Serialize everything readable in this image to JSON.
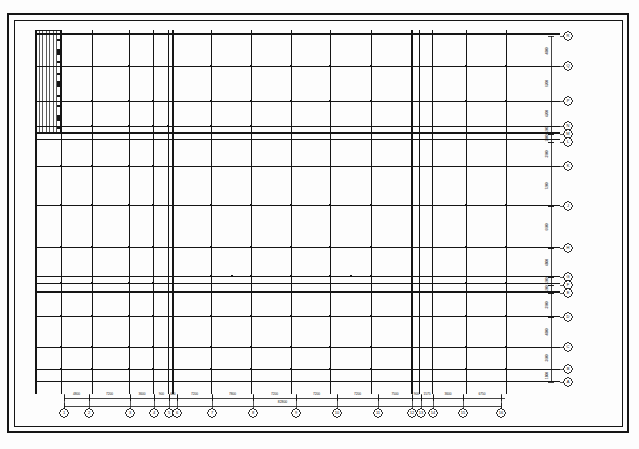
{
  "drawing": {
    "kind": "structural-column-grid-plan",
    "sheet_background": "#fdfdfd",
    "ink_color": "#151515",
    "border": {
      "outer": {
        "x": 8,
        "y": 14,
        "w": 620,
        "h": 418,
        "stroke": "#151515",
        "stroke_width": 1.6
      },
      "inner": {
        "x": 14,
        "y": 20,
        "w": 608,
        "h": 406,
        "stroke": "#151515",
        "stroke_width": 1.0
      }
    },
    "plan_extent": {
      "left": 36,
      "right": 560,
      "top": 30,
      "bottom": 394
    },
    "grid_lines_vertical": [
      {
        "id": "V1",
        "x": 36,
        "weight": 1.5,
        "label": "1"
      },
      {
        "id": "V2",
        "x": 61,
        "weight": 1.0,
        "label": "2"
      },
      {
        "id": "V3",
        "x": 92,
        "weight": 1.0,
        "label": "3"
      },
      {
        "id": "V4",
        "x": 129,
        "weight": 1.0,
        "label": "4"
      },
      {
        "id": "V5",
        "x": 153,
        "weight": 1.0,
        "label": "5"
      },
      {
        "id": "V6",
        "x": 168,
        "weight": 1.0,
        "label": "6"
      },
      {
        "id": "V6a",
        "x": 173,
        "weight": 1.5,
        "label": "6a"
      },
      {
        "id": "V7",
        "x": 211,
        "weight": 1.0,
        "label": "7"
      },
      {
        "id": "V8",
        "x": 251,
        "weight": 1.0,
        "label": "8"
      },
      {
        "id": "V9",
        "x": 291,
        "weight": 1.0,
        "label": "9"
      },
      {
        "id": "V10",
        "x": 330,
        "weight": 1.0,
        "label": "10"
      },
      {
        "id": "V11",
        "x": 371,
        "weight": 1.0,
        "label": "11"
      },
      {
        "id": "V12",
        "x": 412,
        "weight": 1.5,
        "label": "12"
      },
      {
        "id": "V12a",
        "x": 419,
        "weight": 1.0,
        "label": "12a"
      },
      {
        "id": "V13",
        "x": 432,
        "weight": 1.0,
        "label": "13"
      },
      {
        "id": "V14",
        "x": 466,
        "weight": 1.0,
        "label": "14"
      },
      {
        "id": "V15",
        "x": 506,
        "weight": 1.0,
        "label": "15"
      }
    ],
    "grid_lines_horizontal": [
      {
        "id": "HR",
        "y": 34,
        "weight": 1.5,
        "label": "R"
      },
      {
        "id": "HQ",
        "y": 66,
        "weight": 1.0,
        "label": "Q"
      },
      {
        "id": "HP",
        "y": 101,
        "weight": 1.0,
        "label": "P"
      },
      {
        "id": "HN",
        "y": 126,
        "weight": 1.0,
        "label": "N"
      },
      {
        "id": "HM",
        "y": 133,
        "weight": 1.5,
        "label": "M"
      },
      {
        "id": "HL",
        "y": 139,
        "weight": 1.0,
        "label": "L"
      },
      {
        "id": "HK",
        "y": 166,
        "weight": 1.0,
        "label": "K"
      },
      {
        "id": "HJ",
        "y": 205,
        "weight": 1.0,
        "label": "J"
      },
      {
        "id": "HH",
        "y": 247,
        "weight": 1.0,
        "label": "H"
      },
      {
        "id": "HG",
        "y": 276,
        "weight": 1.0,
        "label": "G"
      },
      {
        "id": "HF",
        "y": 283,
        "weight": 1.0,
        "label": "F"
      },
      {
        "id": "HE",
        "y": 292,
        "weight": 1.5,
        "label": "E"
      },
      {
        "id": "HD",
        "y": 316,
        "weight": 1.0,
        "label": "D"
      },
      {
        "id": "HC",
        "y": 347,
        "weight": 1.0,
        "label": "C"
      },
      {
        "id": "HB",
        "y": 369,
        "weight": 1.0,
        "label": "B"
      },
      {
        "id": "HA",
        "y": 381,
        "weight": 1.0,
        "label": "A"
      }
    ],
    "left_hatch_block": {
      "x": 36,
      "y": 30,
      "w": 24,
      "h": 102,
      "line_count": 7,
      "note": "dense vertical hatch strip upper-left"
    },
    "columns": [
      {
        "x": 129,
        "y": 66
      },
      {
        "x": 173,
        "y": 66
      },
      {
        "x": 211,
        "y": 66
      },
      {
        "x": 251,
        "y": 66
      },
      {
        "x": 291,
        "y": 66
      },
      {
        "x": 330,
        "y": 66
      },
      {
        "x": 371,
        "y": 66
      },
      {
        "x": 412,
        "y": 66
      },
      {
        "x": 466,
        "y": 66
      },
      {
        "x": 506,
        "y": 66
      },
      {
        "x": 61,
        "y": 101
      },
      {
        "x": 92,
        "y": 101
      },
      {
        "x": 129,
        "y": 101
      },
      {
        "x": 153,
        "y": 101
      },
      {
        "x": 173,
        "y": 101
      },
      {
        "x": 211,
        "y": 101
      },
      {
        "x": 251,
        "y": 101
      },
      {
        "x": 291,
        "y": 101
      },
      {
        "x": 330,
        "y": 101
      },
      {
        "x": 371,
        "y": 101
      },
      {
        "x": 412,
        "y": 101
      },
      {
        "x": 466,
        "y": 101
      },
      {
        "x": 506,
        "y": 101
      },
      {
        "x": 61,
        "y": 126
      },
      {
        "x": 92,
        "y": 126
      },
      {
        "x": 129,
        "y": 126
      },
      {
        "x": 153,
        "y": 126
      },
      {
        "x": 168,
        "y": 126
      },
      {
        "x": 211,
        "y": 126
      },
      {
        "x": 251,
        "y": 126
      },
      {
        "x": 173,
        "y": 133
      },
      {
        "x": 211,
        "y": 133
      },
      {
        "x": 232,
        "y": 133
      },
      {
        "x": 243,
        "y": 133
      },
      {
        "x": 266,
        "y": 133
      },
      {
        "x": 290,
        "y": 133
      },
      {
        "x": 305,
        "y": 133
      },
      {
        "x": 316,
        "y": 133
      },
      {
        "x": 330,
        "y": 133
      },
      {
        "x": 371,
        "y": 133
      },
      {
        "x": 412,
        "y": 133
      },
      {
        "x": 432,
        "y": 133
      },
      {
        "x": 466,
        "y": 133
      },
      {
        "x": 506,
        "y": 133
      },
      {
        "x": 61,
        "y": 166
      },
      {
        "x": 92,
        "y": 166
      },
      {
        "x": 129,
        "y": 166
      },
      {
        "x": 153,
        "y": 166
      },
      {
        "x": 173,
        "y": 166
      },
      {
        "x": 173,
        "y": 152
      },
      {
        "x": 412,
        "y": 152
      },
      {
        "x": 61,
        "y": 205
      },
      {
        "x": 92,
        "y": 205
      },
      {
        "x": 129,
        "y": 205
      },
      {
        "x": 153,
        "y": 205
      },
      {
        "x": 173,
        "y": 205
      },
      {
        "x": 211,
        "y": 205
      },
      {
        "x": 251,
        "y": 205
      },
      {
        "x": 291,
        "y": 205
      },
      {
        "x": 330,
        "y": 205
      },
      {
        "x": 371,
        "y": 205
      },
      {
        "x": 412,
        "y": 205
      },
      {
        "x": 466,
        "y": 205
      },
      {
        "x": 506,
        "y": 205
      },
      {
        "x": 61,
        "y": 247
      },
      {
        "x": 92,
        "y": 247
      },
      {
        "x": 129,
        "y": 247
      },
      {
        "x": 153,
        "y": 247
      },
      {
        "x": 173,
        "y": 247
      },
      {
        "x": 211,
        "y": 247
      },
      {
        "x": 251,
        "y": 247
      },
      {
        "x": 291,
        "y": 247
      },
      {
        "x": 330,
        "y": 247
      },
      {
        "x": 371,
        "y": 247
      },
      {
        "x": 412,
        "y": 247
      },
      {
        "x": 466,
        "y": 247
      },
      {
        "x": 506,
        "y": 247
      },
      {
        "x": 173,
        "y": 262
      },
      {
        "x": 412,
        "y": 262
      },
      {
        "x": 61,
        "y": 283
      },
      {
        "x": 92,
        "y": 283
      },
      {
        "x": 129,
        "y": 283
      },
      {
        "x": 153,
        "y": 283
      },
      {
        "x": 466,
        "y": 283
      },
      {
        "x": 506,
        "y": 283
      },
      {
        "x": 173,
        "y": 276
      },
      {
        "x": 211,
        "y": 276
      },
      {
        "x": 232,
        "y": 276
      },
      {
        "x": 251,
        "y": 276
      },
      {
        "x": 291,
        "y": 276
      },
      {
        "x": 330,
        "y": 276
      },
      {
        "x": 351,
        "y": 276
      },
      {
        "x": 371,
        "y": 276
      },
      {
        "x": 412,
        "y": 276
      },
      {
        "x": 61,
        "y": 292
      },
      {
        "x": 92,
        "y": 292
      },
      {
        "x": 129,
        "y": 292
      },
      {
        "x": 153,
        "y": 292
      },
      {
        "x": 173,
        "y": 292
      },
      {
        "x": 211,
        "y": 292
      },
      {
        "x": 251,
        "y": 292
      },
      {
        "x": 291,
        "y": 292
      },
      {
        "x": 330,
        "y": 292
      },
      {
        "x": 371,
        "y": 292
      },
      {
        "x": 412,
        "y": 292
      },
      {
        "x": 466,
        "y": 292
      },
      {
        "x": 506,
        "y": 292
      },
      {
        "x": 61,
        "y": 316
      },
      {
        "x": 92,
        "y": 316
      },
      {
        "x": 129,
        "y": 316
      },
      {
        "x": 153,
        "y": 316
      },
      {
        "x": 173,
        "y": 316
      },
      {
        "x": 211,
        "y": 316
      },
      {
        "x": 251,
        "y": 316
      },
      {
        "x": 291,
        "y": 316
      },
      {
        "x": 330,
        "y": 316
      },
      {
        "x": 371,
        "y": 316
      },
      {
        "x": 412,
        "y": 316
      },
      {
        "x": 466,
        "y": 316
      },
      {
        "x": 506,
        "y": 316
      },
      {
        "x": 61,
        "y": 347
      },
      {
        "x": 92,
        "y": 347
      },
      {
        "x": 129,
        "y": 347
      },
      {
        "x": 153,
        "y": 347
      },
      {
        "x": 173,
        "y": 347
      },
      {
        "x": 211,
        "y": 347
      },
      {
        "x": 251,
        "y": 347
      },
      {
        "x": 291,
        "y": 347
      },
      {
        "x": 330,
        "y": 347
      },
      {
        "x": 371,
        "y": 347
      },
      {
        "x": 412,
        "y": 347
      },
      {
        "x": 466,
        "y": 347
      },
      {
        "x": 506,
        "y": 347
      },
      {
        "x": 61,
        "y": 369
      },
      {
        "x": 92,
        "y": 369
      },
      {
        "x": 129,
        "y": 369
      },
      {
        "x": 153,
        "y": 369
      },
      {
        "x": 173,
        "y": 369
      },
      {
        "x": 211,
        "y": 369
      },
      {
        "x": 251,
        "y": 369
      },
      {
        "x": 291,
        "y": 369
      },
      {
        "x": 330,
        "y": 369
      },
      {
        "x": 371,
        "y": 369
      },
      {
        "x": 412,
        "y": 369
      },
      {
        "x": 466,
        "y": 369
      },
      {
        "x": 506,
        "y": 369
      }
    ],
    "bottom_grid_bubbles": [
      {
        "label": "1",
        "x": 64
      },
      {
        "label": "2",
        "x": 89
      },
      {
        "label": "3",
        "x": 130
      },
      {
        "label": "4",
        "x": 154
      },
      {
        "label": "5",
        "x": 169
      },
      {
        "label": "6",
        "x": 177
      },
      {
        "label": "7",
        "x": 212
      },
      {
        "label": "8",
        "x": 253
      },
      {
        "label": "9",
        "x": 296
      },
      {
        "label": "10",
        "x": 337
      },
      {
        "label": "11",
        "x": 378
      },
      {
        "label": "12",
        "x": 412
      },
      {
        "label": "13",
        "x": 421
      },
      {
        "label": "14",
        "x": 433
      },
      {
        "label": "15",
        "x": 463
      },
      {
        "label": "16",
        "x": 501
      }
    ],
    "right_grid_bubbles": [
      {
        "label": "R",
        "y": 36
      },
      {
        "label": "Q",
        "y": 66
      },
      {
        "label": "P",
        "y": 101
      },
      {
        "label": "N",
        "y": 126
      },
      {
        "label": "M",
        "y": 134
      },
      {
        "label": "L",
        "y": 142
      },
      {
        "label": "K",
        "y": 166
      },
      {
        "label": "J",
        "y": 206
      },
      {
        "label": "H",
        "y": 248
      },
      {
        "label": "G",
        "y": 277
      },
      {
        "label": "F",
        "y": 285
      },
      {
        "label": "E",
        "y": 293
      },
      {
        "label": "D",
        "y": 317
      },
      {
        "label": "C",
        "y": 347
      },
      {
        "label": "B",
        "y": 369
      },
      {
        "label": "A",
        "y": 382
      }
    ],
    "bottom_dimensions": [
      {
        "value": "4800",
        "x0": 64,
        "x1": 89
      },
      {
        "value": "7200",
        "x0": 89,
        "x1": 130
      },
      {
        "value": "3600",
        "x0": 130,
        "x1": 154
      },
      {
        "value": "900",
        "x0": 154,
        "x1": 169
      },
      {
        "value": "600",
        "x0": 169,
        "x1": 177
      },
      {
        "value": "7200",
        "x0": 177,
        "x1": 212
      },
      {
        "value": "7800",
        "x0": 212,
        "x1": 253
      },
      {
        "value": "7200",
        "x0": 253,
        "x1": 296
      },
      {
        "value": "7200",
        "x0": 296,
        "x1": 337
      },
      {
        "value": "7200",
        "x0": 337,
        "x1": 378
      },
      {
        "value": "7500",
        "x0": 378,
        "x1": 412
      },
      {
        "value": "900",
        "x0": 412,
        "x1": 421
      },
      {
        "value": "1575",
        "x0": 421,
        "x1": 433
      },
      {
        "value": "3600",
        "x0": 433,
        "x1": 463
      },
      {
        "value": "6750",
        "x0": 463,
        "x1": 501
      }
    ],
    "bottom_overall_dimension": {
      "value": "82800",
      "x0": 64,
      "x1": 501
    },
    "right_dimensions": [
      {
        "value": "4800",
        "y0": 36,
        "y1": 66
      },
      {
        "value": "6200",
        "y0": 66,
        "y1": 101
      },
      {
        "value": "4200",
        "y0": 101,
        "y1": 126
      },
      {
        "value": "1200",
        "y0": 126,
        "y1": 134
      },
      {
        "value": "1000",
        "y0": 134,
        "y1": 142
      },
      {
        "value": "3900",
        "y0": 142,
        "y1": 166
      },
      {
        "value": "7200",
        "y0": 166,
        "y1": 206
      },
      {
        "value": "6600",
        "y0": 206,
        "y1": 248
      },
      {
        "value": "4800",
        "y0": 248,
        "y1": 277
      },
      {
        "value": "1200",
        "y0": 277,
        "y1": 285
      },
      {
        "value": "1200",
        "y0": 285,
        "y1": 293
      },
      {
        "value": "3900",
        "y0": 293,
        "y1": 317
      },
      {
        "value": "4800",
        "y0": 317,
        "y1": 347
      },
      {
        "value": "3600",
        "y0": 347,
        "y1": 369
      },
      {
        "value": "1800",
        "y0": 369,
        "y1": 382
      }
    ]
  }
}
